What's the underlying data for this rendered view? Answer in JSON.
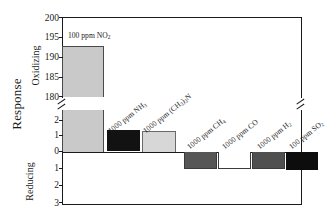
{
  "chart_data": {
    "type": "bar",
    "title": "",
    "xlabel": "",
    "ylabel": "Response",
    "axis_sections": [
      {
        "name": "oxidizing",
        "label": "Oxidizing",
        "ticks": [
          180,
          185,
          190,
          195,
          200
        ],
        "range": [
          180,
          200
        ]
      },
      {
        "name": "mid",
        "label": "",
        "ticks": [
          0,
          1,
          2
        ],
        "range": [
          0,
          2.6
        ]
      },
      {
        "name": "reducing",
        "label": "Reducing",
        "ticks": [
          1,
          2,
          3
        ],
        "range": [
          0,
          3
        ]
      }
    ],
    "axis_break": true,
    "tick_labels_upper": [
      "200",
      "195",
      "190",
      "185",
      "180"
    ],
    "tick_labels_lower": [
      "2",
      "1",
      "0",
      "1",
      "2",
      "3"
    ],
    "grid": false,
    "legend": "none",
    "categories": [
      "100 ppm NO2",
      "1000 ppm NH3",
      "1000 ppm (CH3)3N",
      "1000 ppm CH4",
      "1000 ppm CO",
      "1000 ppm H2",
      "100 ppm SO2"
    ],
    "values": [
      193,
      1.4,
      1.3,
      -1.0,
      -1.0,
      -1.0,
      -1.05
    ],
    "bars": [
      {
        "label_html": "100 ppm NO<sub>2</sub>",
        "label_plain": "100 ppm NO2",
        "value": 193,
        "color": "#c9c9c9",
        "stroke": "#4a4a4a",
        "sign": "positive"
      },
      {
        "label_html": "1000 ppm NH<sub>3</sub>",
        "label_plain": "1000 ppm NH3",
        "value": 1.4,
        "color": "#121212",
        "stroke": "#121212",
        "sign": "positive"
      },
      {
        "label_html": "1000 ppm (CH<sub>3</sub>)<sub>3</sub>N",
        "label_plain": "1000 ppm (CH3)3N",
        "value": 1.3,
        "color": "#d7d7d7",
        "stroke": "#6a6a6a",
        "sign": "positive"
      },
      {
        "label_html": "1000 ppm CH<sub>4</sub>",
        "label_plain": "1000 ppm CH4",
        "value": -1.0,
        "color": "#565656",
        "stroke": "#3a3a3a",
        "sign": "negative"
      },
      {
        "label_html": "1000 ppm CO",
        "label_plain": "1000 ppm CO",
        "value": -1.0,
        "color": "#ffffff",
        "stroke": "#3a3a3a",
        "sign": "negative"
      },
      {
        "label_html": "1000 ppm H<sub>2</sub>",
        "label_plain": "1000 ppm H2",
        "value": -1.0,
        "color": "#4f4f4f",
        "stroke": "#3a3a3a",
        "sign": "negative"
      },
      {
        "label_html": "100 ppm SO<sub>2</sub>",
        "label_plain": "100 ppm SO2",
        "value": -1.05,
        "color": "#0d0d0d",
        "stroke": "#0d0d0d",
        "sign": "negative"
      }
    ],
    "colors": {
      "axis": "#1a1a1a",
      "background": "#ffffff"
    }
  },
  "axis": {
    "response_label": "Response",
    "oxidizing_label": "Oxidizing",
    "reducing_label": "Reducing"
  }
}
